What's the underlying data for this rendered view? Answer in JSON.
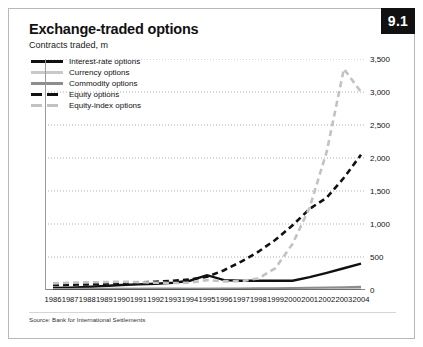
{
  "card": {
    "badge": "9.1",
    "title": "Exchange-traded options",
    "subtitle": "Contracts traded, m",
    "source": "Source: Bank for International Settlements"
  },
  "colors": {
    "interest_rate": "#111111",
    "currency": "#c9c9c9",
    "commodity": "#8d8d8d",
    "equity": "#111111",
    "equity_index": "#c2c2c2",
    "grid": "#9a9a9a",
    "axis": "#111111",
    "badge_bg": "#111111",
    "badge_text": "#ffffff"
  },
  "legend": {
    "items": [
      {
        "label": "Interest-rate options",
        "key": "interest_rate"
      },
      {
        "label": "Currency options",
        "key": "currency"
      },
      {
        "label": "Commodity options",
        "key": "commodity"
      },
      {
        "label": "Equity options",
        "key": "equity"
      },
      {
        "label": "Equity-index options",
        "key": "equity_index"
      }
    ]
  },
  "chart_data": {
    "type": "line",
    "title": "Exchange-traded options",
    "subtitle": "Contracts traded, m",
    "xlabel": "",
    "ylabel": "Contracts traded, m",
    "ylim": [
      0,
      3500
    ],
    "yticks": [
      0,
      500,
      1000,
      1500,
      2000,
      2500,
      3000,
      3500
    ],
    "ytick_labels": [
      "0",
      "500",
      "1,000",
      "1,500",
      "2,000",
      "2,500",
      "3,000",
      "3,500"
    ],
    "y_axis_position": "right",
    "grid": true,
    "grid_style": "dotted",
    "legend_position": "top-left",
    "x": [
      1986,
      1987,
      1988,
      1989,
      1990,
      1991,
      1992,
      1993,
      1994,
      1995,
      1996,
      1997,
      1998,
      1999,
      2000,
      2001,
      2002,
      2003,
      2004
    ],
    "xtick_labels": [
      "1986",
      "1987",
      "1988",
      "1989",
      "1990",
      "1991",
      "1992",
      "1993",
      "1994",
      "1995",
      "1996",
      "1997",
      "1998",
      "1999",
      "2000",
      "2001",
      "2002",
      "2003",
      "2004"
    ],
    "series": [
      {
        "name": "Interest-rate options",
        "key": "interest_rate",
        "color": "#111111",
        "style": "solid",
        "width": 2.4,
        "values": [
          30,
          35,
          45,
          60,
          75,
          85,
          95,
          110,
          140,
          225,
          150,
          140,
          140,
          140,
          140,
          195,
          260,
          330,
          400
        ]
      },
      {
        "name": "Currency options",
        "key": "currency",
        "color": "#c9c9c9",
        "style": "solid",
        "width": 2.2,
        "values": [
          12,
          14,
          16,
          20,
          24,
          26,
          25,
          24,
          22,
          20,
          18,
          16,
          14,
          13,
          12,
          11,
          11,
          12,
          13
        ]
      },
      {
        "name": "Commodity options",
        "key": "commodity",
        "color": "#8d8d8d",
        "style": "solid",
        "width": 2.2,
        "values": [
          8,
          9,
          10,
          12,
          14,
          15,
          16,
          17,
          18,
          19,
          20,
          22,
          24,
          26,
          30,
          34,
          38,
          42,
          46
        ]
      },
      {
        "name": "Equity options",
        "key": "equity",
        "color": "#111111",
        "style": "dashed",
        "width": 2.6,
        "values": [
          75,
          80,
          85,
          95,
          105,
          115,
          125,
          140,
          160,
          200,
          300,
          430,
          580,
          760,
          980,
          1230,
          1400,
          1700,
          2050
        ]
      },
      {
        "name": "Equity-index options",
        "key": "equity_index",
        "color": "#c2c2c2",
        "style": "dashed",
        "width": 2.6,
        "values": [
          100,
          110,
          115,
          120,
          125,
          120,
          110,
          105,
          110,
          150,
          130,
          135,
          175,
          330,
          700,
          1250,
          2100,
          3350,
          3000
        ]
      }
    ]
  }
}
